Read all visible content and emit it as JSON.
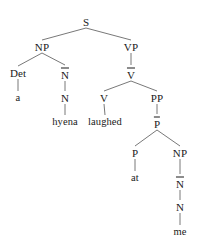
{
  "diagram": {
    "title": "",
    "type": "syntax-tree",
    "sentence": "a hyena laughed at me",
    "colors": {
      "background": "#ffffff",
      "text": "#1a1a1a",
      "edge": "#555555"
    },
    "nodes": [
      {
        "id": "s",
        "label": "S",
        "x": 86,
        "y": 22,
        "bar": false,
        "terminal": false
      },
      {
        "id": "np1",
        "label": "NP",
        "x": 42,
        "y": 47,
        "bar": false,
        "terminal": false
      },
      {
        "id": "vp",
        "label": "VP",
        "x": 131,
        "y": 47,
        "bar": false,
        "terminal": false
      },
      {
        "id": "det",
        "label": "Det",
        "x": 18,
        "y": 73,
        "bar": false,
        "terminal": false
      },
      {
        "id": "nbar1",
        "label": "N",
        "x": 65,
        "y": 74,
        "bar": true,
        "terminal": false
      },
      {
        "id": "vbar",
        "label": "V",
        "x": 131,
        "y": 74,
        "bar": true,
        "terminal": false
      },
      {
        "id": "a",
        "label": "a",
        "x": 18,
        "y": 98,
        "bar": false,
        "terminal": true
      },
      {
        "id": "n1",
        "label": "N",
        "x": 65,
        "y": 98,
        "bar": false,
        "terminal": false
      },
      {
        "id": "v",
        "label": "V",
        "x": 104,
        "y": 98,
        "bar": false,
        "terminal": false
      },
      {
        "id": "pp",
        "label": "PP",
        "x": 157,
        "y": 98,
        "bar": false,
        "terminal": false
      },
      {
        "id": "hyena",
        "label": "hyena",
        "x": 65,
        "y": 122,
        "bar": false,
        "terminal": true
      },
      {
        "id": "laughed",
        "label": "laughed",
        "x": 105,
        "y": 122,
        "bar": false,
        "terminal": true
      },
      {
        "id": "pbar",
        "label": "P",
        "x": 157,
        "y": 123,
        "bar": true,
        "terminal": false
      },
      {
        "id": "p",
        "label": "P",
        "x": 135,
        "y": 153,
        "bar": false,
        "terminal": false
      },
      {
        "id": "np2",
        "label": "NP",
        "x": 180,
        "y": 153,
        "bar": false,
        "terminal": false
      },
      {
        "id": "at",
        "label": "at",
        "x": 135,
        "y": 178,
        "bar": false,
        "terminal": true
      },
      {
        "id": "nbar2",
        "label": "N",
        "x": 180,
        "y": 183,
        "bar": true,
        "terminal": false
      },
      {
        "id": "n2",
        "label": "N",
        "x": 180,
        "y": 207,
        "bar": false,
        "terminal": false
      },
      {
        "id": "me",
        "label": "me",
        "x": 180,
        "y": 232,
        "bar": false,
        "terminal": true
      }
    ],
    "edges": [
      {
        "from": "s",
        "to": "np1"
      },
      {
        "from": "s",
        "to": "vp"
      },
      {
        "from": "np1",
        "to": "det"
      },
      {
        "from": "np1",
        "to": "nbar1"
      },
      {
        "from": "vp",
        "to": "vbar"
      },
      {
        "from": "det",
        "to": "a"
      },
      {
        "from": "nbar1",
        "to": "n1"
      },
      {
        "from": "vbar",
        "to": "v"
      },
      {
        "from": "vbar",
        "to": "pp"
      },
      {
        "from": "n1",
        "to": "hyena"
      },
      {
        "from": "v",
        "to": "laughed"
      },
      {
        "from": "pp",
        "to": "pbar"
      },
      {
        "from": "pbar",
        "to": "p"
      },
      {
        "from": "pbar",
        "to": "np2"
      },
      {
        "from": "p",
        "to": "at"
      },
      {
        "from": "np2",
        "to": "nbar2"
      },
      {
        "from": "nbar2",
        "to": "n2"
      },
      {
        "from": "n2",
        "to": "me"
      }
    ]
  }
}
